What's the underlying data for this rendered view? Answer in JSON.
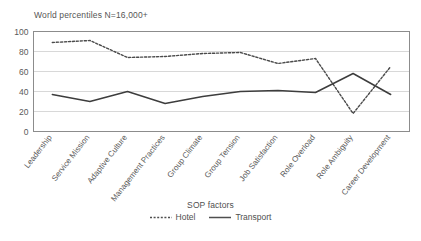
{
  "chart_data": {
    "type": "line",
    "title": "World percentiles N=16,000+",
    "xlabel": "SOP factors",
    "ylabel": "",
    "ylim": [
      0,
      100
    ],
    "yticks": [
      0,
      20,
      40,
      60,
      80,
      100
    ],
    "grid": true,
    "legend_position": "bottom",
    "categories": [
      "Leadership",
      "Service Mission",
      "Adaptive Culture",
      "Management Practices",
      "Group Climate",
      "Group Tension",
      "Job Satisfaction",
      "Role Overload",
      "Role Ambiguity",
      "Career Development"
    ],
    "series": [
      {
        "name": "Hotel",
        "style": "dotted",
        "color": "#4a4a4a",
        "values": [
          89,
          91,
          74,
          75,
          78,
          79,
          68,
          73,
          18,
          65
        ]
      },
      {
        "name": "Transport",
        "style": "solid",
        "color": "#3d3d3d",
        "values": [
          37,
          30,
          40,
          28,
          35,
          40,
          41,
          39,
          58,
          37
        ]
      }
    ]
  },
  "legend": {
    "axis_title": "SOP factors",
    "entries": [
      {
        "label": "Hotel",
        "style": "dotted"
      },
      {
        "label": "Transport",
        "style": "solid"
      }
    ]
  },
  "colors": {
    "axis": "#8c8c8c",
    "grid": "#d8d8d8",
    "text": "#4f4f4f",
    "hotel": "#4a4a4a",
    "transport": "#3d3d3d",
    "background": "#ffffff"
  }
}
